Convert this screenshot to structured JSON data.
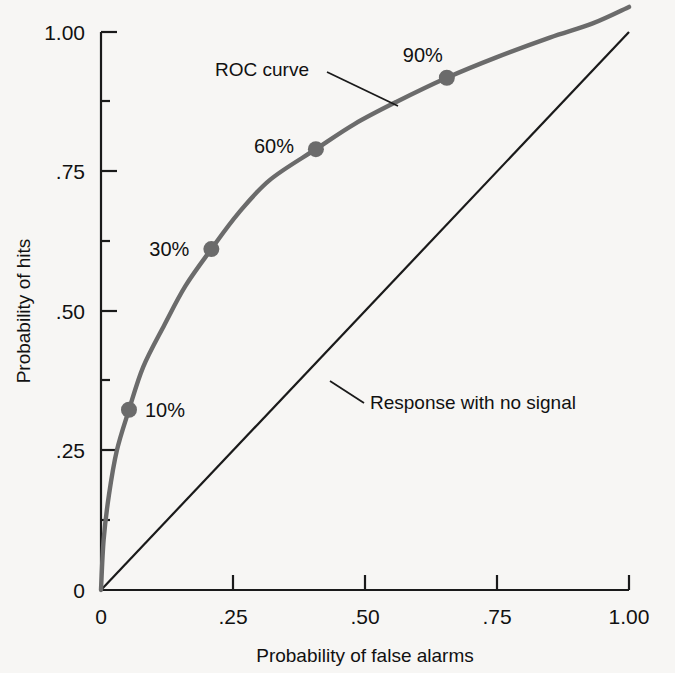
{
  "figure": {
    "background_color": "#f7f6f4",
    "curve_color": "#6b6b6b",
    "line_color": "#1a1a1a",
    "marker_color": "#6b6b6b",
    "text_color": "#111111"
  },
  "chart_data": {
    "type": "line",
    "title": "",
    "xlabel": "Probability of false alarms",
    "ylabel": "Probability of hits",
    "xlim": [
      0,
      1.0
    ],
    "ylim": [
      0,
      1.0
    ],
    "grid": false,
    "legend_position": "none",
    "xticks": [
      0,
      0.25,
      0.5,
      0.75,
      1.0
    ],
    "xtick_labels": [
      "0",
      ".25",
      ".50",
      ".75",
      "1.00"
    ],
    "yticks": [
      0,
      0.25,
      0.5,
      0.75,
      1.0
    ],
    "ytick_labels": [
      "0",
      ".25",
      ".50",
      ".75",
      "1.00"
    ],
    "minor_yticks": [
      0.125,
      0.375,
      0.625,
      0.875
    ],
    "series": [
      {
        "name": "ROC curve",
        "style": "solid-gray",
        "x": [
          0.0,
          0.005,
          0.015,
          0.03,
          0.053,
          0.08,
          0.12,
          0.16,
          0.209,
          0.26,
          0.32,
          0.407,
          0.48,
          0.56,
          0.655,
          0.75,
          0.85,
          0.93,
          1.0
        ],
        "y": [
          0.0,
          0.09,
          0.17,
          0.25,
          0.323,
          0.4,
          0.475,
          0.545,
          0.611,
          0.675,
          0.735,
          0.79,
          0.835,
          0.875,
          0.918,
          0.955,
          0.99,
          1.015,
          1.045
        ]
      },
      {
        "name": "Response with no signal",
        "style": "solid-black-diagonal",
        "x": [
          0.0,
          1.0
        ],
        "y": [
          0.0,
          1.0
        ]
      }
    ],
    "data_points": [
      {
        "label": "10%",
        "x": 0.053,
        "y": 0.323,
        "label_dx": 16,
        "label_dy": 7
      },
      {
        "label": "30%",
        "x": 0.209,
        "y": 0.611,
        "label_dx": -62,
        "label_dy": 7
      },
      {
        "label": "60%",
        "x": 0.407,
        "y": 0.79,
        "label_dx": -62,
        "label_dy": 4
      },
      {
        "label": "90%",
        "x": 0.655,
        "y": 0.918,
        "label_dx": -44,
        "label_dy": -16
      }
    ],
    "annotations": [
      {
        "text": "ROC curve",
        "text_x": 215,
        "text_y": 76,
        "leader_from_x": 327,
        "leader_from_y": 72,
        "leader_to_x": 398,
        "leader_to_y": 106
      },
      {
        "text": "Response with no signal",
        "text_x": 370,
        "text_y": 409,
        "leader_from_x": 364,
        "leader_from_y": 403,
        "leader_to_x": 330,
        "leader_to_y": 381
      }
    ]
  }
}
